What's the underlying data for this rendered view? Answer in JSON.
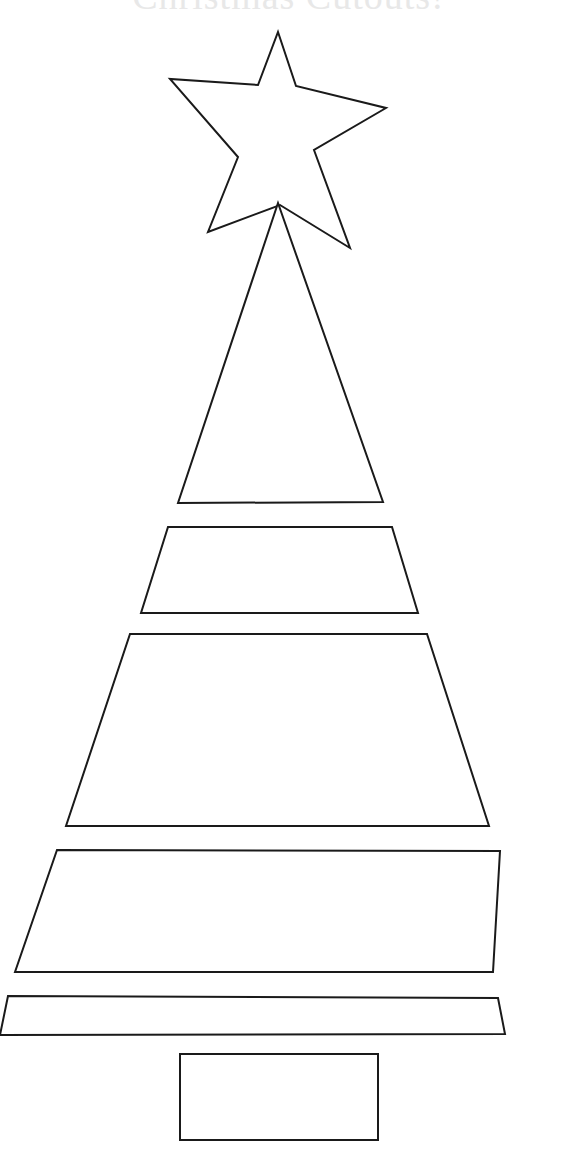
{
  "page": {
    "title": "Christmas Cutouts!",
    "background_color": "#ffffff",
    "width": 577,
    "height": 1176
  },
  "heading": {
    "text": "Christmas Cutouts!",
    "color": "#e8e8e8",
    "note": "faint heading cropped by the top edge of the page"
  },
  "template": {
    "name": "christmas-tree-cutout-template",
    "description": "Printable craft template: black outline cut-out pieces of a Christmas tree on a white page",
    "stroke_color": "#1a1a1a",
    "fill_color": "#ffffff",
    "stroke_width": 2,
    "pieces": [
      {
        "id": "star",
        "label": "Star Topper",
        "shape": "5-point-star",
        "points": "278,32 296,86 386,108 314,150 350,248 280,205 208,232 238,157 170,79 258,85"
      },
      {
        "id": "tier-1",
        "label": "Tree Tier 1 (Top Triangle)",
        "shape": "triangle",
        "points": "278,203 383,502 178,503"
      },
      {
        "id": "tier-2",
        "label": "Tree Tier 2 (Trapezoid)",
        "shape": "trapezoid",
        "points": "168,527 392,527 418,613 141,613"
      },
      {
        "id": "tier-3",
        "label": "Tree Tier 3 (Trapezoid)",
        "shape": "trapezoid",
        "points": "130,634 427,634 489,826 66,826"
      },
      {
        "id": "tier-4",
        "label": "Tree Tier 4 (Trapezoid)",
        "shape": "trapezoid",
        "points": "57,850 500,851 493,972 15,972"
      },
      {
        "id": "tier-5",
        "label": "Tree Tier 5 (Base Strip)",
        "shape": "trapezoid-strip",
        "points": "8,996 498,998 505,1034 0,1035"
      },
      {
        "id": "trunk",
        "label": "Tree Trunk (Rectangle)",
        "shape": "rectangle",
        "points": "180,1054 378,1054 378,1140 180,1140"
      }
    ]
  }
}
